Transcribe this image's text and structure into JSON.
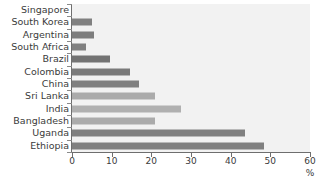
{
  "chart_data": {
    "type": "bar",
    "orientation": "horizontal",
    "title": "",
    "subtitle": "",
    "xlabel": "%",
    "ylabel": "",
    "xlim": [
      0,
      60
    ],
    "xticks": [
      0,
      10,
      20,
      30,
      40,
      50,
      60
    ],
    "xticklabels": [
      "0",
      "10",
      "20",
      "30",
      "40",
      "50",
      "60"
    ],
    "grid": false,
    "legend": false,
    "categories": [
      "Singapore",
      "South Korea",
      "Argentina",
      "South Africa",
      "Brazil",
      "Colombia",
      "China",
      "Sri Lanka",
      "India",
      "Bangladesh",
      "Uganda",
      "Ethiopia"
    ],
    "values": [
      0,
      5,
      5.5,
      3.5,
      9.5,
      14.5,
      17,
      21,
      27.5,
      21,
      43.5,
      48.5
    ],
    "bar_colors": [
      "#808080",
      "#808080",
      "#7d7d7d",
      "#808080",
      "#737373",
      "#7a7a7a",
      "#808080",
      "#ababab",
      "#b0b0b0",
      "#ababab",
      "#808080",
      "#808080"
    ],
    "plot_background": "#f2f2f2",
    "axis_color": "#6e6e6e",
    "label_color": "#3b3b3b"
  }
}
